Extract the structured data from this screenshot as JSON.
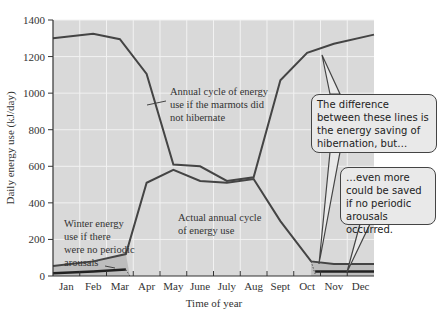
{
  "chart_data": {
    "type": "line",
    "title": "",
    "xlabel": "Time of year",
    "ylabel": "Daily energy use (kJ/day)",
    "ylim": [
      0,
      1400
    ],
    "yticks": [
      0,
      200,
      400,
      600,
      800,
      1000,
      1200,
      1400
    ],
    "grid": true,
    "categories": [
      "Jan",
      "Feb",
      "Mar",
      "Apr",
      "May",
      "June",
      "July",
      "Aug",
      "Sept",
      "Oct",
      "Nov",
      "Dec"
    ],
    "series": [
      {
        "name": "Annual cycle of energy use if the marmots did not hibernate",
        "values": [
          1300,
          1325,
          1295,
          1105,
          610,
          600,
          520,
          540,
          1070,
          1220,
          1270,
          1320
        ]
      },
      {
        "name": "Actual annual cycle of energy use",
        "values": [
          55,
          80,
          120,
          510,
          580,
          520,
          510,
          530,
          300,
          80,
          65,
          65
        ]
      },
      {
        "name": "Winter energy use if there were no periodic arousals",
        "values": [
          15,
          25,
          35,
          null,
          null,
          null,
          null,
          null,
          null,
          null,
          25,
          25
        ]
      }
    ],
    "annotations": [
      "Annual cycle of energy use if the marmots did not hibernate",
      "Actual annual cycle of energy use",
      "Winter energy use if there were no periodic arousals",
      "The difference between these lines is the energy saving of hibernation, but…",
      "…even more could be saved if no periodic arousals occurred."
    ]
  },
  "labels": {
    "ylabel": "Daily energy use (kJ/day)",
    "xlabel": "Time of year",
    "ann_nohib": [
      "Annual cycle of energy",
      "use if the marmots did",
      "not hibernate"
    ],
    "ann_actual": [
      "Actual annual cycle",
      "of energy use"
    ],
    "ann_noarousal": [
      "Winter energy",
      "use if there",
      "were no periodic",
      "arousals"
    ],
    "callout1": "The difference between these lines is the energy saving of hibernation, but…",
    "callout2": "…even more could be saved if no periodic arousals occurred."
  },
  "colors": {
    "plot_bg": "#d9d9d9",
    "line": "#444444",
    "grid": "#f2f2f2",
    "shade": "#bdbdbd"
  }
}
